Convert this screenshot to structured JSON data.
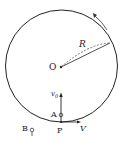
{
  "diagram": {
    "title": "",
    "labels": {
      "center": "O",
      "radius": "R",
      "initial_velocity": "v0",
      "initial_velocity_base": "v",
      "initial_velocity_sub": "0",
      "point_a": "A",
      "point_p": "P",
      "point_b": "B",
      "velocity": "V"
    },
    "elements": {
      "circle": "circular track with center O and radius R",
      "rotation_arrow": "counterclockwise curved arrow at upper right",
      "radius_lines": "solid and dashed lines from O to circle edge",
      "vertical_arrow": "v0 arrow pointing up from P through A",
      "horizontal_arrow": "V arrow pointing right at P",
      "particle_a": "small ball at A",
      "particle_b": "small pendulum-like object at B outside circle"
    },
    "colors": {
      "stroke": "#222222",
      "background": "#ffffff"
    }
  }
}
